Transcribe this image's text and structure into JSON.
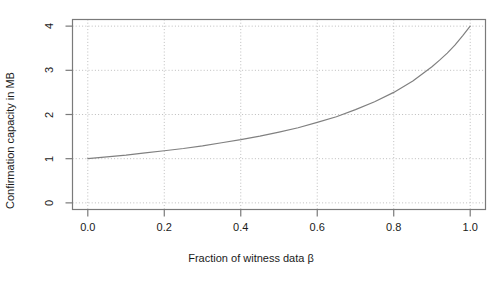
{
  "chart_data": {
    "type": "line",
    "title": "",
    "xlabel": "Fraction of witness data β",
    "ylabel": "Confirmation capacity in MB",
    "xlim": [
      -0.04,
      1.04
    ],
    "ylim": [
      -0.15,
      4.15
    ],
    "xticks": [
      "0.0",
      "0.2",
      "0.4",
      "0.6",
      "0.8",
      "1.0"
    ],
    "xtick_values": [
      0.0,
      0.2,
      0.4,
      0.6,
      0.8,
      1.0
    ],
    "yticks": [
      "0",
      "1",
      "2",
      "3",
      "4"
    ],
    "ytick_values": [
      0,
      1,
      2,
      3,
      4
    ],
    "grid": true,
    "grid_style": "dotted",
    "legend": null,
    "series": [
      {
        "name": "Confirmation capacity",
        "color": "#808080",
        "x": [
          0.0,
          0.05,
          0.1,
          0.15,
          0.2,
          0.25,
          0.3,
          0.35,
          0.4,
          0.45,
          0.5,
          0.55,
          0.6,
          0.65,
          0.7,
          0.75,
          0.8,
          0.85,
          0.9,
          0.92,
          0.94,
          0.96,
          0.98,
          1.0
        ],
        "y": [
          1.0,
          1.04,
          1.08,
          1.13,
          1.18,
          1.23,
          1.29,
          1.36,
          1.43,
          1.51,
          1.6,
          1.7,
          1.82,
          1.95,
          2.11,
          2.29,
          2.5,
          2.76,
          3.08,
          3.23,
          3.39,
          3.57,
          3.78,
          4.0
        ]
      }
    ],
    "colors": {
      "curve": "#808080",
      "grid": "#bdbdbd",
      "frame": "#7a7a7a",
      "text": "#1a1a1a",
      "background": "#ffffff"
    }
  }
}
